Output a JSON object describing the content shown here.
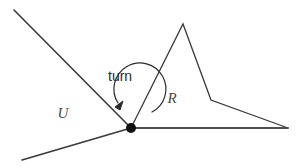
{
  "figure": {
    "background_color": "#ffffff",
    "width": 307,
    "height": 167,
    "stroke_color": "#3a3a3a",
    "accent_color": "#111111",
    "label_color": "#4a4a4a",
    "labels": {
      "region_left": "U",
      "region_right": "R",
      "turn": "turn"
    },
    "label_positions": {
      "region_left": {
        "x": 63,
        "y": 118
      },
      "region_right": {
        "x": 172,
        "y": 103
      },
      "turn": {
        "x": 108,
        "y": 81
      }
    },
    "vertex": {
      "x": 131,
      "y": 128,
      "radius": 5
    },
    "rays": [
      {
        "name": "upper-left-ray",
        "x1": 14,
        "y1": 10,
        "x2": 131,
        "y2": 128
      },
      {
        "name": "lower-left-ray",
        "x1": 22,
        "y1": 160,
        "x2": 131,
        "y2": 128
      },
      {
        "name": "horizontal-right-ray",
        "x1": 131,
        "y1": 128,
        "x2": 288,
        "y2": 128
      }
    ],
    "polygon_r": {
      "name": "region-r-outline",
      "points": "131,128 183,24 211,100 288,128"
    },
    "turn_arc": {
      "path": "M 118 103 A 26 26 0 1 1 152 112",
      "arrow_tip": {
        "x": 115,
        "y": 107
      },
      "arrow_points": "115,107 123,101 120,110"
    }
  }
}
